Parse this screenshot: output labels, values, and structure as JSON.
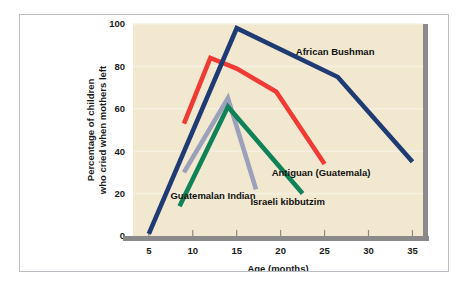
{
  "chart_data": {
    "type": "line",
    "title": "",
    "xlabel": "Age (months)",
    "ylabel": "Percentage of children who cried when mothers left",
    "ylabel_line1": "Percentage of children",
    "ylabel_line2": "who cried when mothers left",
    "xlim": [
      3.2,
      36.2
    ],
    "ylim": [
      0,
      100
    ],
    "xticks": [
      5,
      10,
      15,
      20,
      25,
      30,
      35
    ],
    "xtick_labels": [
      "5",
      "10",
      "15",
      "20",
      "25",
      "30",
      "35"
    ],
    "yticks": [
      0,
      20,
      40,
      60,
      80,
      100
    ],
    "ytick_labels": [
      "0",
      "20",
      "40",
      "60",
      "80",
      "100"
    ],
    "grid": "horizontal",
    "legend_position": "inline-annotations",
    "plot_background": "#f2e8cf",
    "series": [
      {
        "name": "African Bushman",
        "color": "#1f3b73",
        "label": "African Bushman",
        "label_x": 26.2,
        "label_y": 85.5,
        "x": [
          5,
          15,
          26.5,
          35
        ],
        "y": [
          1,
          98,
          75,
          35
        ]
      },
      {
        "name": "Antiguan (Guatemala)",
        "color": "#ef3b33",
        "label": "Antiguan (Guatemala)",
        "label_x": 24.6,
        "label_y": 28.5,
        "x": [
          9,
          12,
          15,
          19.5,
          25
        ],
        "y": [
          53,
          84,
          79,
          68,
          34
        ]
      },
      {
        "name": "Israeli kibbutzim",
        "color": "#0f8257",
        "label": "Israeli kibbutzim",
        "label_x": 20.8,
        "label_y": 14.5,
        "x": [
          8.5,
          14,
          22.5
        ],
        "y": [
          14,
          61,
          20
        ]
      },
      {
        "name": "Guatemalan Indian",
        "color": "#9ba0bb",
        "label": "Guatemalan Indian",
        "label_x": 12.3,
        "label_y": 17.5,
        "x": [
          9,
          14,
          17.2
        ],
        "y": [
          30,
          65,
          22
        ]
      }
    ]
  }
}
